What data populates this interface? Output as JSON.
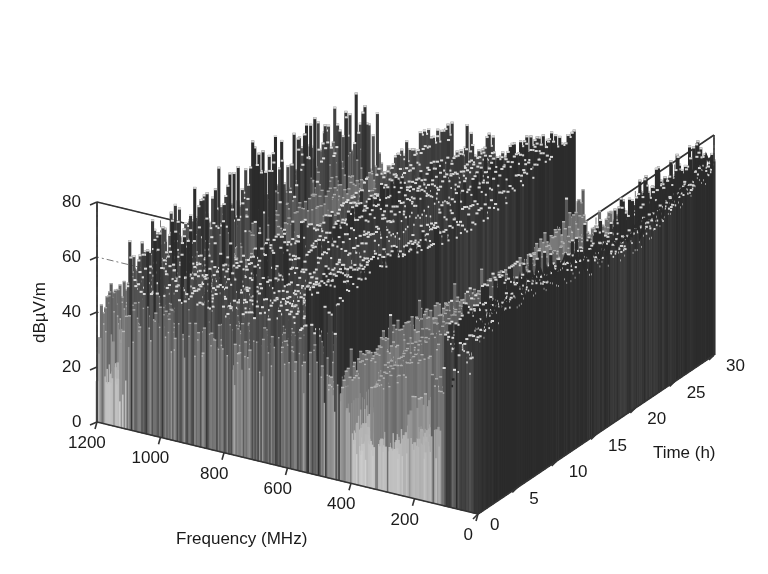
{
  "figure": {
    "title": "",
    "background_color": "#ffffff",
    "width": 768,
    "height": 574
  },
  "chart_data": {
    "type": "surface",
    "subtype": "3d-waterfall-spectrogram",
    "title": "",
    "xlabel": "Frequency (MHz)",
    "ylabel": "Time (h)",
    "zlabel": "dBµV/m",
    "xlim": [
      0,
      1200
    ],
    "ylim": [
      0,
      30
    ],
    "zlim": [
      0,
      80
    ],
    "x_ticks": [
      1200,
      1000,
      800,
      600,
      400,
      200,
      0
    ],
    "y_ticks": [
      0,
      5,
      10,
      15,
      20,
      25,
      30
    ],
    "z_ticks": [
      0,
      20,
      40,
      60,
      80
    ],
    "x_tick_labels": [
      "1200",
      "1000",
      "800",
      "600",
      "400",
      "200",
      "0"
    ],
    "y_tick_labels": [
      "0",
      "5",
      "10",
      "15",
      "20",
      "25",
      "30"
    ],
    "z_tick_labels": [
      "0",
      "20",
      "40",
      "60",
      "80"
    ],
    "x_axis_direction": "reversed",
    "grid": true,
    "grid_style": "dash-dot",
    "grid_color": "#7a7a7a",
    "box": true,
    "box_color": "#333333",
    "legend": false,
    "colormap": "gray",
    "colormap_stops": [
      "#2b2b2b",
      "#555555",
      "#8c8c8c",
      "#bdbdbd",
      "#e8e8e8"
    ],
    "view_azimuth": -37.5,
    "view_elevation": 22,
    "features": [
      {
        "name": "low-frequency-ridge",
        "freq_mhz": [
          0,
          120
        ],
        "time_h": [
          0,
          30
        ],
        "peak_dbuvm": 62,
        "shade": "dark",
        "note": "Persistent dark high-amplitude ridge along the near-0 MHz edge across all times"
      },
      {
        "name": "broadcast-fm-band",
        "freq_mhz": [
          88,
          108
        ],
        "time_h": [
          0,
          30
        ],
        "peak_dbuvm": 58,
        "shade": "bright"
      },
      {
        "name": "mid-band-plateau",
        "freq_mhz": [
          400,
          900
        ],
        "time_h": [
          0,
          30
        ],
        "peak_dbuvm": 40,
        "shade": "medium"
      },
      {
        "name": "noise-floor",
        "freq_mhz": [
          0,
          1200
        ],
        "time_h": [
          0,
          30
        ],
        "peak_dbuvm": 22,
        "shade": "medium-dark"
      },
      {
        "name": "early-time-spikes",
        "freq_mhz": [
          500,
          1100
        ],
        "time_h": [
          0,
          6
        ],
        "peak_dbuvm": 52,
        "shade": "bright"
      }
    ],
    "geometry": {
      "origin_front": [
        478,
        514
      ],
      "corner_freq_max_time_min": [
        97,
        422
      ],
      "corner_freq_min_time_max": [
        714,
        355
      ],
      "corner_top_back": [
        328,
        33
      ],
      "z_pixels_per_unit": 2.75
    },
    "axis_tick_positions": {
      "z": [
        {
          "value": 80,
          "px_y": 202
        },
        {
          "value": 60,
          "px_y": 257
        },
        {
          "value": 40,
          "px_y": 312
        },
        {
          "value": 20,
          "px_y": 367
        },
        {
          "value": 0,
          "px_y": 422
        }
      ]
    }
  },
  "labels": {
    "x_axis": "Frequency (MHz)",
    "y_axis": "Time (h)",
    "z_axis": "dBµV/m"
  }
}
